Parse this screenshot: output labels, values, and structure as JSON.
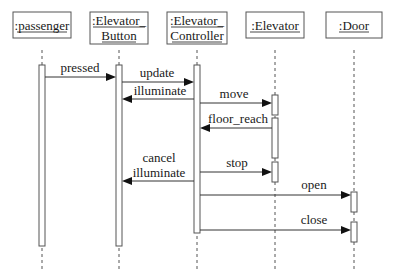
{
  "diagram": {
    "type": "uml-sequence-diagram",
    "objects": [
      {
        "id": "passenger",
        "lines": [
          ":passenger"
        ]
      },
      {
        "id": "button",
        "lines": [
          ":Elevator_",
          "Button"
        ]
      },
      {
        "id": "controller",
        "lines": [
          ":Elevator_",
          "Controller"
        ]
      },
      {
        "id": "elevator",
        "lines": [
          ":Elevator"
        ]
      },
      {
        "id": "door",
        "lines": [
          ":Door"
        ]
      }
    ],
    "messages": [
      {
        "id": "pressed",
        "from": "passenger",
        "to": "button",
        "lines": [
          "pressed"
        ]
      },
      {
        "id": "update",
        "from": "button",
        "to": "controller",
        "lines": [
          "update"
        ]
      },
      {
        "id": "illuminate",
        "from": "controller",
        "to": "button",
        "lines": [
          "illuminate"
        ]
      },
      {
        "id": "move",
        "from": "controller",
        "to": "elevator",
        "lines": [
          "move"
        ]
      },
      {
        "id": "floor_reach",
        "from": "elevator",
        "to": "controller",
        "lines": [
          "floor_reach"
        ]
      },
      {
        "id": "cancel_illuminate",
        "from": "controller",
        "to": "button",
        "lines": [
          "cancel",
          "illuminate"
        ]
      },
      {
        "id": "stop",
        "from": "controller",
        "to": "elevator",
        "lines": [
          "stop"
        ]
      },
      {
        "id": "open",
        "from": "controller",
        "to": "door",
        "lines": [
          "open"
        ]
      },
      {
        "id": "close",
        "from": "controller",
        "to": "door",
        "lines": [
          "close"
        ]
      }
    ]
  }
}
